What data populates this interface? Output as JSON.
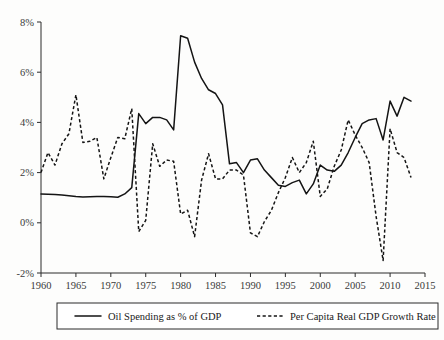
{
  "chart_data": {
    "type": "line",
    "title": "",
    "xlabel": "",
    "ylabel": "",
    "xlim": [
      1960,
      2015
    ],
    "ylim": [
      -2,
      8
    ],
    "grid": false,
    "legend_position": "bottom",
    "x_ticks": [
      "1960",
      "1965",
      "1970",
      "1975",
      "1980",
      "1985",
      "1990",
      "1995",
      "2000",
      "2005",
      "2010",
      "2015"
    ],
    "x_tick_values": [
      1960,
      1965,
      1970,
      1975,
      1980,
      1985,
      1990,
      1995,
      2000,
      2005,
      2010,
      2015
    ],
    "y_ticks": [
      "-2%",
      "0%",
      "2%",
      "4%",
      "6%",
      "8%"
    ],
    "y_tick_values": [
      -2,
      0,
      2,
      4,
      6,
      8
    ],
    "x": [
      1960,
      1961,
      1962,
      1963,
      1964,
      1965,
      1966,
      1967,
      1968,
      1969,
      1970,
      1971,
      1972,
      1973,
      1974,
      1975,
      1976,
      1977,
      1978,
      1979,
      1980,
      1981,
      1982,
      1983,
      1984,
      1985,
      1986,
      1987,
      1988,
      1989,
      1990,
      1991,
      1992,
      1993,
      1994,
      1995,
      1996,
      1997,
      1998,
      1999,
      2000,
      2001,
      2002,
      2003,
      2004,
      2005,
      2006,
      2007,
      2008,
      2009,
      2010,
      2011,
      2012,
      2013
    ],
    "series": [
      {
        "name": "Oil Spending as % of GDP",
        "style": "solid",
        "values": [
          1.15,
          1.14,
          1.13,
          1.11,
          1.08,
          1.05,
          1.03,
          1.04,
          1.05,
          1.05,
          1.04,
          1.02,
          1.15,
          1.4,
          4.35,
          3.95,
          4.2,
          4.2,
          4.1,
          3.7,
          7.45,
          7.35,
          6.4,
          5.75,
          5.3,
          5.15,
          4.7,
          2.35,
          2.4,
          2.0,
          2.5,
          2.55,
          2.1,
          1.8,
          1.5,
          1.45,
          1.6,
          1.7,
          1.15,
          1.55,
          2.3,
          2.1,
          2.05,
          2.3,
          2.8,
          3.4,
          3.95,
          4.1,
          4.15,
          3.3,
          4.85,
          4.25,
          5.0,
          4.85
        ],
        "values_note_endpoints": [
          [
            1960,
            1.15
          ],
          [
            1980,
            7.45
          ],
          [
            2013,
            4.85
          ]
        ]
      },
      {
        "name": "Per Capita Real GDP Growth Rate",
        "style": "dashed",
        "values": [
          2.0,
          2.8,
          2.3,
          3.15,
          3.55,
          5.1,
          3.2,
          3.25,
          3.4,
          1.75,
          2.6,
          3.4,
          3.35,
          4.55,
          -0.35,
          0.1,
          3.15,
          2.25,
          2.5,
          2.45,
          0.35,
          0.5,
          -0.55,
          1.7,
          2.75,
          1.75,
          1.75,
          2.1,
          2.1,
          1.9,
          -0.4,
          -0.55,
          0.05,
          0.5,
          1.2,
          1.8,
          2.6,
          2.0,
          2.4,
          3.25,
          1.05,
          1.35,
          2.25,
          2.9,
          4.1,
          3.5,
          3.0,
          2.4,
          0.25,
          -1.5,
          3.75,
          2.8,
          2.6,
          1.8
        ],
        "values_note_endpoints": [
          [
            1960,
            2.0
          ],
          [
            1965,
            5.1
          ],
          [
            2009,
            -1.5
          ],
          [
            2013,
            1.8
          ]
        ]
      }
    ],
    "legend": [
      {
        "label": "Oil Spending as % of GDP",
        "style": "solid"
      },
      {
        "label": "Per Capita Real GDP Growth Rate",
        "style": "dashed"
      }
    ],
    "colors": {
      "series": "#141414",
      "axis": "#2b2b2b",
      "tick_text": "#3a3a3a",
      "background": "#fdfdfc"
    }
  }
}
